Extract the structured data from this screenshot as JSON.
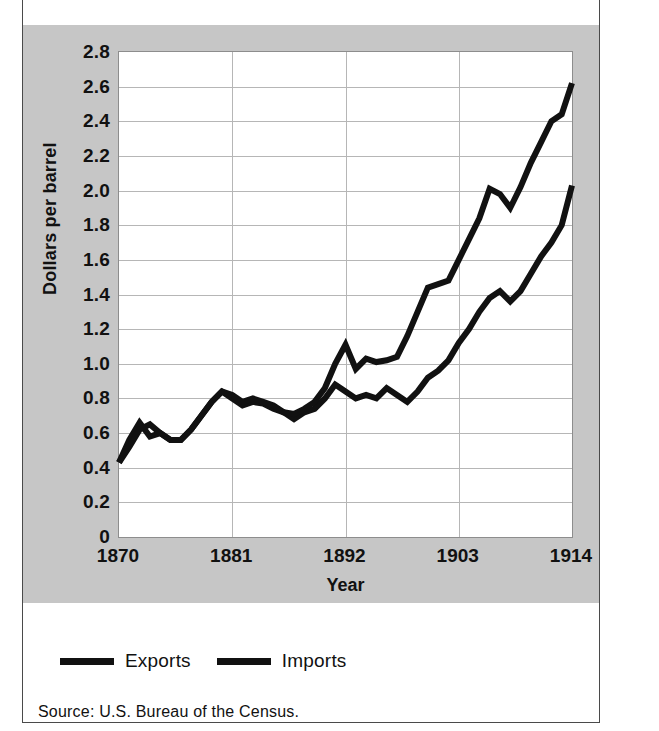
{
  "figure": {
    "axis_label_x": "Year",
    "axis_label_y": "Dollars per barrel",
    "source_note": "Source: U.S. Bureau of the Census."
  },
  "legend": {
    "position": "below-plot",
    "items": [
      {
        "label": "Exports",
        "color": "#111111"
      },
      {
        "label": "Imports",
        "color": "#111111"
      }
    ]
  },
  "chart_data": {
    "type": "line",
    "title": "",
    "subtitle": "",
    "xlabel": "Year",
    "ylabel": "Dollars per barrel",
    "xlim": [
      1870,
      1914
    ],
    "ylim": [
      0,
      2.8
    ],
    "grid": true,
    "legend_position": "below-plot",
    "x_ticks": [
      "1870",
      "1881",
      "1892",
      "1903",
      "1914"
    ],
    "x_tick_values": [
      1870,
      1881,
      1892,
      1903,
      1914
    ],
    "y_ticks": [
      "0",
      "0.2",
      "0.4",
      "0.6",
      "0.8",
      "1.0",
      "1.2",
      "1.4",
      "1.6",
      "1.8",
      "2.0",
      "2.2",
      "2.4",
      "2.6",
      "2.8"
    ],
    "y_tick_values": [
      0,
      0.2,
      0.4,
      0.6,
      0.8,
      1.0,
      1.2,
      1.4,
      1.6,
      1.8,
      2.0,
      2.2,
      2.4,
      2.6,
      2.8
    ],
    "annotations": [
      "Source: U.S. Bureau of the Census."
    ],
    "x": [
      1870,
      1871,
      1872,
      1873,
      1874,
      1875,
      1876,
      1877,
      1878,
      1879,
      1880,
      1881,
      1882,
      1883,
      1884,
      1885,
      1886,
      1887,
      1888,
      1889,
      1890,
      1891,
      1892,
      1893,
      1894,
      1895,
      1896,
      1897,
      1898,
      1899,
      1900,
      1901,
      1902,
      1903,
      1904,
      1905,
      1906,
      1907,
      1908,
      1909,
      1910,
      1911,
      1912,
      1913,
      1914
    ],
    "series": [
      {
        "name": "Exports",
        "color": "#111111",
        "values": [
          0.43,
          0.56,
          0.66,
          0.58,
          0.6,
          0.56,
          0.56,
          0.62,
          0.7,
          0.78,
          0.84,
          0.8,
          0.76,
          0.78,
          0.77,
          0.74,
          0.72,
          0.68,
          0.72,
          0.74,
          0.8,
          0.88,
          0.84,
          0.8,
          0.82,
          0.8,
          0.86,
          0.82,
          0.78,
          0.84,
          0.92,
          0.96,
          1.02,
          1.12,
          1.2,
          1.3,
          1.38,
          1.42,
          1.36,
          1.42,
          1.52,
          1.62,
          1.7,
          1.8,
          2.03
        ]
      },
      {
        "name": "Imports",
        "color": "#111111",
        "values": [
          0.43,
          0.52,
          0.62,
          0.65,
          0.6,
          0.56,
          0.56,
          0.62,
          0.7,
          0.78,
          0.84,
          0.82,
          0.78,
          0.8,
          0.78,
          0.76,
          0.72,
          0.71,
          0.74,
          0.78,
          0.86,
          1.0,
          1.11,
          0.97,
          1.03,
          1.01,
          1.02,
          1.04,
          1.16,
          1.3,
          1.44,
          1.46,
          1.48,
          1.6,
          1.72,
          1.84,
          2.01,
          1.98,
          1.9,
          2.02,
          2.16,
          2.28,
          2.4,
          2.44,
          2.62
        ]
      }
    ]
  }
}
